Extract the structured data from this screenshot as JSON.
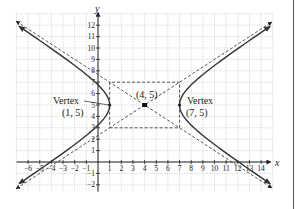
{
  "chart_data": {
    "type": "line",
    "title": "",
    "xlabel": "x",
    "ylabel": "y",
    "xlim": [
      -7,
      15
    ],
    "ylim": [
      -3,
      13
    ],
    "grid": true,
    "legend": null,
    "x_ticks": [
      -6,
      -5,
      -4,
      -3,
      -2,
      -1,
      1,
      2,
      3,
      4,
      5,
      6,
      7,
      8,
      9,
      10,
      11,
      12,
      13,
      14
    ],
    "y_ticks": [
      -2,
      -1,
      1,
      2,
      3,
      4,
      5,
      6,
      7,
      8,
      9,
      10,
      11,
      12
    ],
    "hyperbola": {
      "center": [
        4,
        5
      ],
      "a": 3,
      "b": 2,
      "orientation": "horizontal",
      "equation": "(x-4)^2/9 - (y-5)^2/4 = 1"
    },
    "series": [
      {
        "name": "left branch",
        "style": "solid",
        "vertex": [
          1,
          5
        ]
      },
      {
        "name": "right branch",
        "style": "solid",
        "vertex": [
          7,
          5
        ]
      },
      {
        "name": "asymptote 1",
        "style": "dashed",
        "slope": 0.6667,
        "through": [
          4,
          5
        ]
      },
      {
        "name": "asymptote 2",
        "style": "dashed",
        "slope": -0.6667,
        "through": [
          4,
          5
        ]
      },
      {
        "name": "fundamental rectangle",
        "style": "dashed",
        "corners": [
          [
            1,
            3
          ],
          [
            7,
            3
          ],
          [
            7,
            7
          ],
          [
            1,
            7
          ]
        ]
      }
    ],
    "annotations": [
      {
        "text": "Vertex",
        "subtext": "(1, 5)",
        "point": [
          1,
          5
        ]
      },
      {
        "text": "Vertex",
        "subtext": "(7, 5)",
        "point": [
          7,
          5
        ]
      },
      {
        "text": "(4, 5)",
        "point": [
          4,
          5
        ],
        "marker": "center-point"
      }
    ]
  },
  "labels": {
    "x_axis": "x",
    "y_axis": "y",
    "vertex_left_title": "Vertex",
    "vertex_left_coords": "(1, 5)",
    "vertex_right_title": "Vertex",
    "vertex_right_coords": "(7, 5)",
    "center_coords": "(4, 5)"
  },
  "colors": {
    "grid": "#c8c8c8",
    "axis": "#222222",
    "curve": "#333333",
    "dashed": "#444444"
  }
}
